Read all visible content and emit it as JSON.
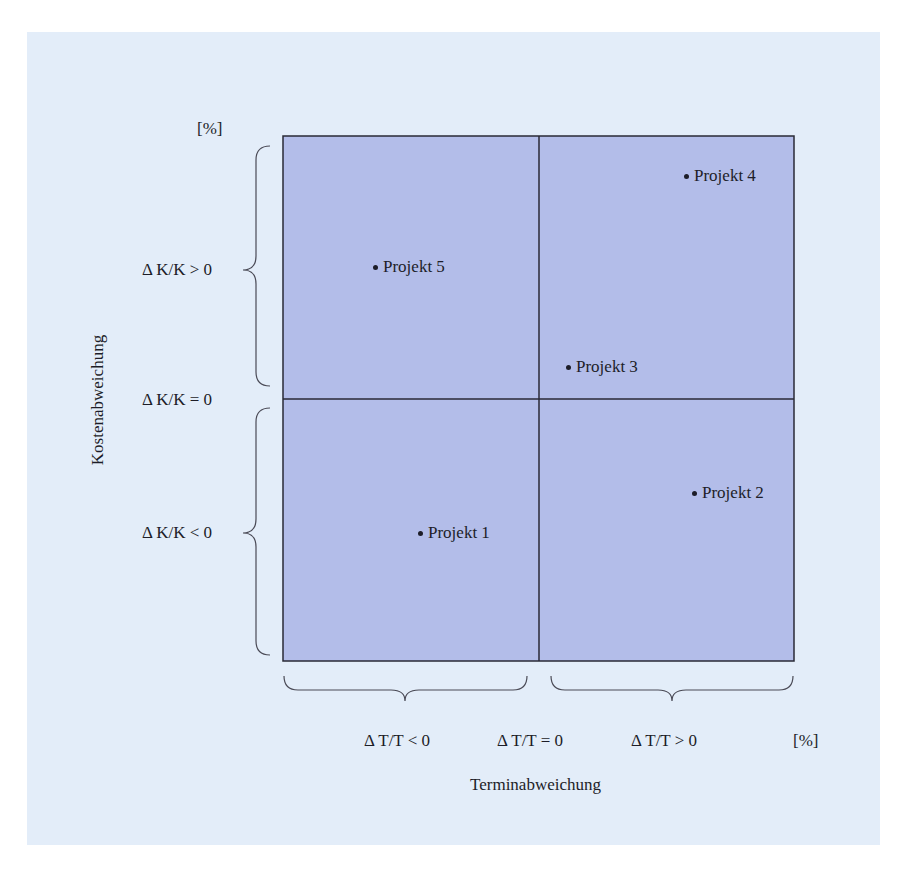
{
  "figure": {
    "background_color": "#e3edf9",
    "quadrant_fill": "#b3bde9",
    "line_color": "#2a2a36"
  },
  "axes": {
    "y_unit": "[%]",
    "x_unit": "[%]",
    "y_title": "Kostenabweichung",
    "x_title": "Terminabweichung",
    "y_labels": {
      "positive": "Δ K/K > 0",
      "zero": "Δ K/K = 0",
      "negative": "Δ K/K < 0"
    },
    "x_labels": {
      "negative": "Δ T/T < 0",
      "zero": "Δ T/T = 0",
      "positive": "Δ T/T > 0"
    }
  },
  "projects": [
    {
      "label": "Projekt 1",
      "quadrant": "ΔT<0, ΔK<0"
    },
    {
      "label": "Projekt 2",
      "quadrant": "ΔT>0, ΔK<0"
    },
    {
      "label": "Projekt 3",
      "quadrant": "ΔT>0, ΔK>0"
    },
    {
      "label": "Projekt 4",
      "quadrant": "ΔT>0, ΔK>0"
    },
    {
      "label": "Projekt 5",
      "quadrant": "ΔT<0, ΔK>0"
    }
  ]
}
